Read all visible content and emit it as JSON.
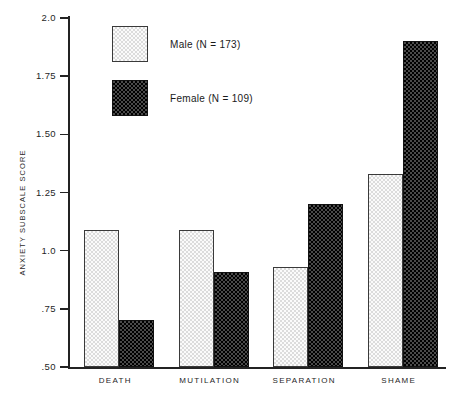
{
  "chart_data": {
    "type": "bar",
    "title": "",
    "xlabel": "",
    "ylabel": "ANXIETY SUBSCALE SCORE",
    "categories": [
      "DEATH",
      "MUTILATION",
      "SEPARATION",
      "SHAME"
    ],
    "series": [
      {
        "name": "Male (N = 173)",
        "values": [
          1.09,
          1.09,
          0.93,
          1.33
        ]
      },
      {
        "name": "Female (N = 109)",
        "values": [
          0.7,
          0.91,
          1.2,
          1.9
        ]
      }
    ],
    "ylim": [
      0.5,
      2.0
    ],
    "yticks": [
      0.5,
      0.75,
      1.0,
      1.25,
      1.5,
      1.75,
      2.0
    ],
    "ytick_labels": [
      ".50",
      ".75",
      "1.0",
      "1.25",
      "1.50",
      "1.75",
      "2.0"
    ],
    "grid": false,
    "legend_position": "top-left-inside",
    "legend": [
      {
        "label": "Male (N = 173)",
        "swatch": "light-dotted",
        "color": "#f2f2f2"
      },
      {
        "label": "Female (N = 109)",
        "swatch": "dark-checkered",
        "color": "#1c1c1c"
      }
    ],
    "axis_color": "#232323"
  }
}
